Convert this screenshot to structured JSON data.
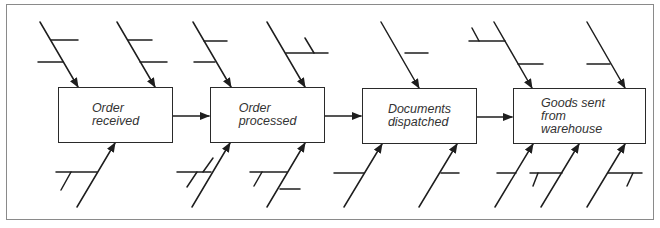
{
  "diagram": {
    "type": "cause-and-effect process chain",
    "steps": [
      {
        "id": "step-1",
        "lines": [
          "Order",
          "received"
        ]
      },
      {
        "id": "step-2",
        "lines": [
          "Order",
          "processed"
        ]
      },
      {
        "id": "step-3",
        "lines": [
          "Documents",
          "dispatched"
        ]
      },
      {
        "id": "step-4",
        "lines": [
          "Goods sent",
          "from",
          "warehouse"
        ]
      }
    ],
    "colors": {
      "line": "#1e1e1e",
      "text": "#333333",
      "frame": "#8a8a8a",
      "background": "#ffffff"
    }
  }
}
